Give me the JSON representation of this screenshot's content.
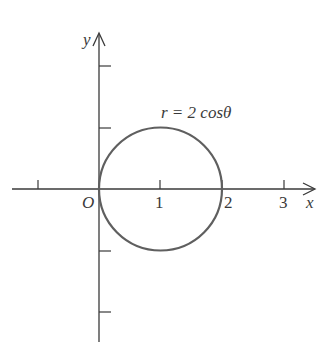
{
  "figure": {
    "curve_label": "r = 2 cosθ",
    "axes": {
      "x_label": "x",
      "y_label": "y",
      "origin_label": "O"
    },
    "x_ticks": [
      {
        "value": -1,
        "label": ""
      },
      {
        "value": 1,
        "label": "1"
      },
      {
        "value": 2,
        "label": "2"
      },
      {
        "value": 3,
        "label": "3"
      }
    ],
    "y_ticks": [
      {
        "value": 2,
        "label": ""
      },
      {
        "value": 1,
        "label": ""
      },
      {
        "value": -1,
        "label": ""
      },
      {
        "value": -2,
        "label": ""
      }
    ],
    "curve": {
      "type": "circle",
      "equation": "r = 2 cosθ",
      "center": [
        1,
        0
      ],
      "radius": 1
    },
    "colors": {
      "axis": "#3a3a3a",
      "curve": "#5f5f5f",
      "background": "#ffffff"
    }
  }
}
